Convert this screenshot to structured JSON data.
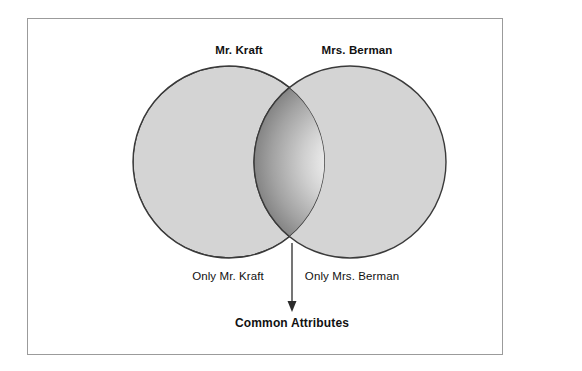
{
  "diagram": {
    "type": "venn",
    "title_visible": false,
    "sets": [
      {
        "id": "left",
        "label": "Mr. Kraft",
        "exclusive_label": "Only Mr. Kraft",
        "center_x": 229,
        "center_y": 162,
        "radius": 96,
        "fill": "#d4d4d4",
        "stroke": "#3a3a3a"
      },
      {
        "id": "right",
        "label": "Mrs. Berman",
        "exclusive_label": "Only Mrs. Berman",
        "center_x": 350,
        "center_y": 162,
        "radius": 96,
        "fill": "#d4d4d4",
        "stroke": "#3a3a3a"
      }
    ],
    "intersection": {
      "label": "Common Attributes",
      "gradient_center": "#fdfdfd",
      "gradient_mid": "#c2c2c2",
      "gradient_edge": "#6e6e6e",
      "center_x": 292,
      "center_y": 162
    },
    "annotation_arrow": {
      "from_x": 292,
      "from_y": 243,
      "to_x": 292,
      "to_y": 311,
      "color": "#2b2b2b"
    },
    "frame": {
      "border_color": "#9b9b9b",
      "background": "#ffffff"
    },
    "page_background": "#ffffff"
  }
}
